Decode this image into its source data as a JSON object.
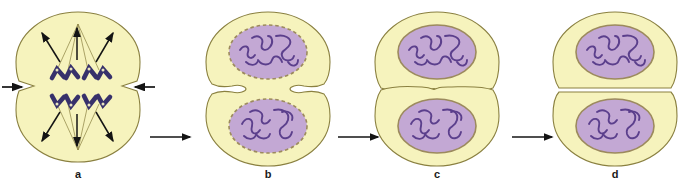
{
  "figure": {
    "type": "biological-process-diagram",
    "stage_count": 4,
    "panels": [
      {
        "id": "a",
        "label": "a",
        "stage_name": "anaphase-telophase-with-cleavage-furrow-beginning",
        "description": "Cell with spindle fibers, two sets of V-shaped chromosomes moving to opposite poles, shallow cleavage furrow forming at the equator",
        "chromosomes_visible": true,
        "chromosome_count_upper": 4,
        "chromosome_count_lower": 4,
        "nuclei_visible": false,
        "spindle_arrows_upper": 3,
        "spindle_arrows_lower": 3,
        "furrow_depth": "shallow",
        "furrow_arrows": 2
      },
      {
        "id": "b",
        "label": "b",
        "stage_name": "telophase-nuclei-reformed",
        "description": "Two daughter nuclei reformed with dashed nuclear envelopes and chromatin threads; cleavage furrow deepening",
        "chromosomes_visible": false,
        "nuclei_visible": true,
        "nucleus_count": 2,
        "nuclear_envelope": "dashed",
        "furrow_depth": "medium",
        "furrow_arrows": 0
      },
      {
        "id": "c",
        "label": "c",
        "stage_name": "late-cytokinesis-midbody",
        "description": "Cleavage furrow nearly complete, cells connected by a thin midbody; nuclei have solid envelopes",
        "chromosomes_visible": false,
        "nuclei_visible": true,
        "nucleus_count": 2,
        "nuclear_envelope": "solid",
        "furrow_depth": "deep",
        "furrow_arrows": 0
      },
      {
        "id": "d",
        "label": "d",
        "stage_name": "two-separate-daughter-cells",
        "description": "Two fully separated daughter cells, each with one nucleus",
        "chromosomes_visible": false,
        "nuclei_visible": true,
        "nucleus_count": 2,
        "nuclear_envelope": "solid",
        "furrow_depth": "complete",
        "furrow_arrows": 0
      }
    ],
    "transition_arrows": [
      {
        "from": "a",
        "to": "b",
        "direction": "right"
      },
      {
        "from": "b",
        "to": "c",
        "direction": "right"
      },
      {
        "from": "c",
        "to": "d",
        "direction": "right"
      }
    ],
    "furrow_indicator_arrows": [
      {
        "side": "left",
        "direction": "right",
        "meaning": "inward-pinching-force"
      },
      {
        "side": "right",
        "direction": "left",
        "meaning": "inward-pinching-force"
      }
    ],
    "colors": {
      "cytoplasm": "#f6f3bd",
      "cell_outline": "#8a8040",
      "nucleus_fill": "#c3a8d4",
      "nucleus_outline": "#9c8a5e",
      "chromatin": "#5b3f8c",
      "chromosome": "#37316b",
      "spindle_fiber": "#8a8040",
      "arrow": "#141414",
      "label_text": "#1a1a1a",
      "background": "#ffffff"
    }
  }
}
